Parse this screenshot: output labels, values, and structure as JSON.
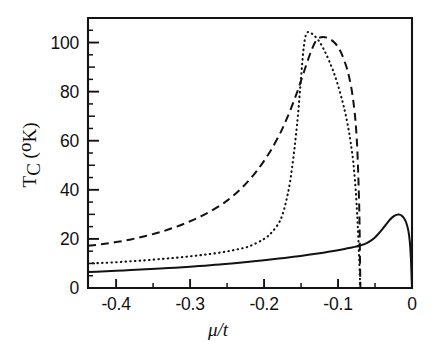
{
  "figure": {
    "background_color": "#ffffff",
    "ink_color": "#121212"
  },
  "chart_data": {
    "type": "line",
    "title": "",
    "subtitle": "",
    "xlabel": "μ/t",
    "ylabel": "T_C (°K)",
    "ylabel_main": "T",
    "ylabel_sub": "C",
    "ylabel_unit_open": "(",
    "ylabel_unit_deg": "o",
    "ylabel_unit_k": "K)",
    "xlim": [
      -0.438,
      0.0
    ],
    "ylim": [
      0,
      110
    ],
    "grid": false,
    "legend": "none",
    "x_ticks": [
      -0.4,
      -0.3,
      -0.2,
      -0.1,
      0
    ],
    "x_tick_labels": [
      "-0.4",
      "-0.3",
      "-0.2",
      "-0.1",
      "0"
    ],
    "x_minor_ticks": [
      -0.35,
      -0.25,
      -0.15,
      -0.05
    ],
    "y_ticks": [
      0,
      20,
      40,
      60,
      80,
      100
    ],
    "y_tick_labels": [
      "0",
      "20",
      "40",
      "60",
      "80",
      "100"
    ],
    "y_minor_ticks": [
      10,
      30,
      50,
      70,
      90
    ],
    "y_minor_ticks_fine": [
      5,
      15,
      25,
      35,
      45,
      55,
      65,
      75,
      85,
      95,
      105
    ],
    "series": [
      {
        "name": "solid-curve",
        "style": "solid",
        "x": [
          -0.438,
          -0.42,
          -0.4,
          -0.38,
          -0.36,
          -0.34,
          -0.32,
          -0.3,
          -0.28,
          -0.26,
          -0.24,
          -0.22,
          -0.2,
          -0.18,
          -0.16,
          -0.14,
          -0.12,
          -0.1,
          -0.09,
          -0.08,
          -0.07,
          -0.06,
          -0.05,
          -0.04,
          -0.03,
          -0.025,
          -0.02,
          -0.017,
          -0.014,
          -0.011,
          -0.008,
          -0.005,
          -0.003,
          -0.0015,
          0.0
        ],
        "y": [
          6.5,
          6.7,
          7.0,
          7.3,
          7.6,
          7.9,
          8.3,
          8.7,
          9.1,
          9.6,
          10.1,
          10.7,
          11.3,
          12.0,
          12.7,
          13.5,
          14.4,
          15.4,
          16.0,
          16.6,
          17.3,
          18.5,
          20.6,
          24.0,
          27.8,
          29.2,
          29.9,
          29.9,
          29.5,
          28.5,
          26.8,
          23.5,
          19.0,
          12.0,
          0.0
        ]
      },
      {
        "name": "dotted-curve",
        "style": "dotted",
        "x": [
          -0.438,
          -0.42,
          -0.4,
          -0.38,
          -0.36,
          -0.34,
          -0.32,
          -0.3,
          -0.28,
          -0.26,
          -0.24,
          -0.22,
          -0.2,
          -0.19,
          -0.18,
          -0.175,
          -0.17,
          -0.165,
          -0.16,
          -0.157,
          -0.154,
          -0.151,
          -0.148,
          -0.146,
          -0.144,
          -0.142,
          -0.14,
          -0.136,
          -0.132,
          -0.128,
          -0.124,
          -0.118,
          -0.112,
          -0.106,
          -0.1,
          -0.094,
          -0.09,
          -0.086,
          -0.083,
          -0.08,
          -0.078,
          -0.076,
          -0.0745,
          -0.0735,
          -0.0725,
          -0.0715,
          -0.0705,
          -0.07
        ],
        "y": [
          10.0,
          10.2,
          10.5,
          10.9,
          11.3,
          11.8,
          12.3,
          12.9,
          13.6,
          14.4,
          15.5,
          17.0,
          20.0,
          22.5,
          26.5,
          30.0,
          35.5,
          43.0,
          54.0,
          62.0,
          71.0,
          82.0,
          93.0,
          99.0,
          102.5,
          104.0,
          104.3,
          103.8,
          102.8,
          101.5,
          99.8,
          96.5,
          92.5,
          88.0,
          82.5,
          76.0,
          71.0,
          65.0,
          59.5,
          53.0,
          47.0,
          39.5,
          32.0,
          26.5,
          20.0,
          12.5,
          5.0,
          0.0
        ]
      },
      {
        "name": "dashed-curve",
        "style": "dashed",
        "x": [
          -0.438,
          -0.42,
          -0.4,
          -0.38,
          -0.36,
          -0.34,
          -0.32,
          -0.3,
          -0.28,
          -0.26,
          -0.25,
          -0.24,
          -0.23,
          -0.22,
          -0.21,
          -0.2,
          -0.19,
          -0.18,
          -0.175,
          -0.17,
          -0.165,
          -0.16,
          -0.155,
          -0.15,
          -0.145,
          -0.14,
          -0.135,
          -0.13,
          -0.125,
          -0.12,
          -0.115,
          -0.11,
          -0.105,
          -0.1,
          -0.096,
          -0.092,
          -0.088,
          -0.085,
          -0.082,
          -0.0795,
          -0.077,
          -0.0755,
          -0.074,
          -0.0728,
          -0.0718,
          -0.071,
          -0.0704,
          -0.07,
          -0.0698
        ],
        "y": [
          17.2,
          17.8,
          18.7,
          19.8,
          21.2,
          22.8,
          24.8,
          27.2,
          30.0,
          33.5,
          35.6,
          38.0,
          40.8,
          44.0,
          47.6,
          51.8,
          56.5,
          62.0,
          65.0,
          68.5,
          72.0,
          76.0,
          80.0,
          84.5,
          89.0,
          93.5,
          97.5,
          100.6,
          102.0,
          102.3,
          102.0,
          101.3,
          100.0,
          98.2,
          96.0,
          93.0,
          89.5,
          86.0,
          81.5,
          76.5,
          70.0,
          64.5,
          57.0,
          47.5,
          38.0,
          28.0,
          14.0,
          5.0,
          0.0
        ]
      }
    ]
  }
}
